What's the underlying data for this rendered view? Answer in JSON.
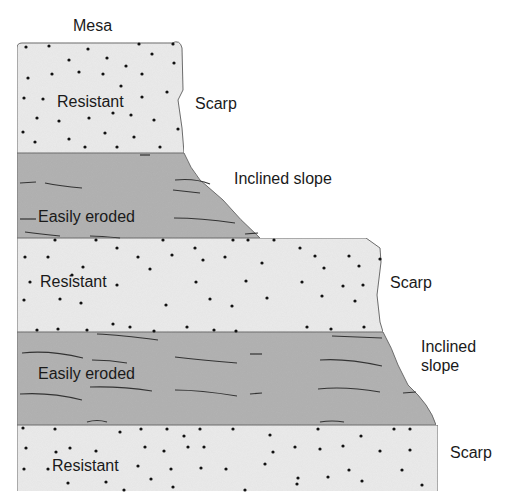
{
  "title": "Mesa",
  "colors": {
    "resistant_fill": "#ececec",
    "eroded_fill": "#b4b4b4",
    "outline": "#6e6e6e",
    "dot": "#111111",
    "bedding_line": "#333333"
  },
  "layers": [
    {
      "id": "layer-1",
      "type": "resistant",
      "label": "Resistant",
      "feature": "Scarp"
    },
    {
      "id": "layer-2",
      "type": "easily-eroded",
      "label": "Easily eroded",
      "feature": "Inclined slope"
    },
    {
      "id": "layer-3",
      "type": "resistant",
      "label": "Resistant",
      "feature": "Scarp"
    },
    {
      "id": "layer-4",
      "type": "easily-eroded",
      "label": "Easily eroded",
      "feature": "Inclined\nslope"
    },
    {
      "id": "layer-5",
      "type": "resistant",
      "label": "Resistant",
      "feature": "Scarp"
    }
  ],
  "labels": {
    "top": "Mesa",
    "layer1_feature": "Scarp",
    "layer2_feature": "Inclined slope",
    "layer3_feature": "Scarp",
    "layer4_feature_line1": "Inclined",
    "layer4_feature_line2": "slope",
    "layer5_feature": "Scarp",
    "layer1_text": "Resistant",
    "layer2_text": "Easily eroded",
    "layer3_text": "Resistant",
    "layer4_text": "Easily eroded",
    "layer5_text": "Resistant"
  }
}
